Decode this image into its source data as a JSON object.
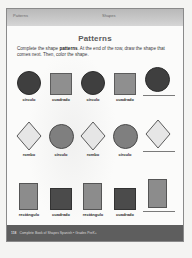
{
  "header": {
    "left_label": "Patterns",
    "right_label": "Shapes"
  },
  "title": "Patterns",
  "instructions": {
    "prefix": "Complete the shape ",
    "bold": "patterns",
    "suffix": ". At the end of the row, draw the shape that comes next. Then, color the shape."
  },
  "rows": [
    {
      "items": [
        {
          "shape": "circle",
          "color": "#3f3f3f",
          "label": "círculo"
        },
        {
          "shape": "square",
          "color": "#8f8f8f",
          "label": "cuadrado"
        },
        {
          "shape": "circle",
          "color": "#3f3f3f",
          "label": "círculo"
        },
        {
          "shape": "square",
          "color": "#8f8f8f",
          "label": "cuadrado"
        }
      ],
      "answer": {
        "shape": "circle",
        "color": "#3f3f3f"
      }
    },
    {
      "items": [
        {
          "shape": "diamond",
          "color": "#e6e6e6",
          "label": "rombo"
        },
        {
          "shape": "circle",
          "color": "#7f7f7f",
          "label": "círculo"
        },
        {
          "shape": "diamond",
          "color": "#e6e6e6",
          "label": "rombo"
        },
        {
          "shape": "circle",
          "color": "#7f7f7f",
          "label": "círculo"
        }
      ],
      "answer": {
        "shape": "diamond",
        "color": "#e6e6e6"
      }
    },
    {
      "items": [
        {
          "shape": "rectangle",
          "color": "#8c8c8c",
          "label": "rectángulo"
        },
        {
          "shape": "square",
          "color": "#4b4b4b",
          "label": "cuadrado"
        },
        {
          "shape": "rectangle",
          "color": "#8c8c8c",
          "label": "rectángulo"
        },
        {
          "shape": "square",
          "color": "#4b4b4b",
          "label": "cuadrado"
        }
      ],
      "answer": {
        "shape": "rectangle",
        "color": "#8c8c8c"
      }
    }
  ],
  "footer": {
    "page_number": "118",
    "text": "Complete Book of Shapes Spanish • Grades PreK+"
  }
}
